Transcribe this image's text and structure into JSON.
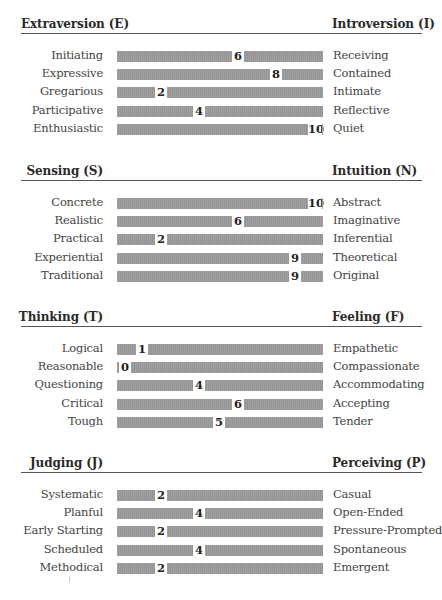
{
  "chart_data": {
    "type": "bar",
    "subtype": "bipolar-preference-scale",
    "scale": [
      0,
      10
    ],
    "sections": [
      {
        "left_pole": "Extraversion (E)",
        "right_pole": "Introversion (I)",
        "left_header_align": "left",
        "items": [
          {
            "left": "Initiating",
            "right": "Receiving",
            "score": 6
          },
          {
            "left": "Expressive",
            "right": "Contained",
            "score": 8
          },
          {
            "left": "Gregarious",
            "right": "Intimate",
            "score": 2
          },
          {
            "left": "Participative",
            "right": "Reflective",
            "score": 4
          },
          {
            "left": "Enthusiastic",
            "right": "Quiet",
            "score": 10
          }
        ]
      },
      {
        "left_pole": "Sensing (S)",
        "right_pole": "Intuition (N)",
        "left_header_align": "right",
        "items": [
          {
            "left": "Concrete",
            "right": "Abstract",
            "score": 10
          },
          {
            "left": "Realistic",
            "right": "Imaginative",
            "score": 6
          },
          {
            "left": "Practical",
            "right": "Inferential",
            "score": 2
          },
          {
            "left": "Experiential",
            "right": "Theoretical",
            "score": 9
          },
          {
            "left": "Traditional",
            "right": "Original",
            "score": 9
          }
        ]
      },
      {
        "left_pole": "Thinking (T)",
        "right_pole": "Feeling (F)",
        "left_header_align": "right",
        "items": [
          {
            "left": "Logical",
            "right": "Empathetic",
            "score": 1
          },
          {
            "left": "Reasonable",
            "right": "Compassionate",
            "score": 0
          },
          {
            "left": "Questioning",
            "right": "Accommodating",
            "score": 4
          },
          {
            "left": "Critical",
            "right": "Accepting",
            "score": 6
          },
          {
            "left": "Tough",
            "right": "Tender",
            "score": 5
          }
        ]
      },
      {
        "left_pole": "Judging (J)",
        "right_pole": "Perceiving (P)",
        "left_header_align": "right",
        "items": [
          {
            "left": "Systematic",
            "right": "Casual",
            "score": 2
          },
          {
            "left": "Planful",
            "right": "Open-Ended",
            "score": 4
          },
          {
            "left": "Early Starting",
            "right": "Pressure-Prompted",
            "score": 2
          },
          {
            "left": "Scheduled",
            "right": "Spontaneous",
            "score": 4
          },
          {
            "left": "Methodical",
            "right": "Emergent",
            "score": 2
          }
        ]
      }
    ],
    "title": "",
    "xlabel": "",
    "ylabel": "",
    "legend": "none",
    "grid": false
  },
  "layout": {
    "section_tops": [
      17,
      164,
      310,
      456
    ],
    "bar_color": "#9b9b9b",
    "text_color": "#444444",
    "divider_color": "#555555"
  }
}
